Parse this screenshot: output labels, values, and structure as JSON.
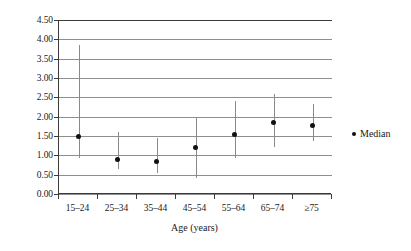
{
  "chart_data": {
    "type": "scatter",
    "title": "",
    "xlabel": "Age (years)",
    "ylabel": "",
    "categories": [
      "15–24",
      "25–34",
      "35–44",
      "45–54",
      "55–64",
      "65–74",
      "≥75"
    ],
    "ylim": [
      0.0,
      4.5
    ],
    "ytick_labels": [
      "0.00",
      "0.50",
      "1.00",
      "1.50",
      "2.00",
      "2.50",
      "3.00",
      "3.50",
      "4.00",
      "4.50"
    ],
    "ytick_values": [
      0.0,
      0.5,
      1.0,
      1.5,
      2.0,
      2.5,
      3.0,
      3.5,
      4.0,
      4.5
    ],
    "grid": true,
    "legend_position": "right",
    "series": [
      {
        "name": "Median",
        "marker": "dot",
        "color": "#111111",
        "values": [
          1.5,
          0.9,
          0.83,
          1.19,
          1.55,
          1.86,
          1.76
        ]
      }
    ],
    "error_bars": {
      "lower": [
        0.93,
        0.65,
        0.55,
        0.41,
        0.93,
        1.22,
        1.37
      ],
      "upper": [
        3.85,
        1.6,
        1.45,
        1.96,
        2.4,
        2.59,
        2.33
      ],
      "color": "#8a8a8a"
    },
    "legend": [
      {
        "label": "Median",
        "marker": "dot",
        "color": "#111111"
      }
    ]
  },
  "colors": {
    "axis": "#3b3b3b",
    "grid": "#8e8e8e",
    "marker": "#111111",
    "whisker": "#8a8a8a",
    "background": "#ffffff"
  }
}
